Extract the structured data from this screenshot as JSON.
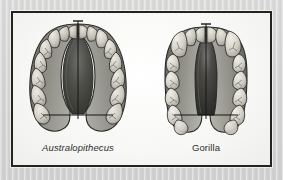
{
  "figure": {
    "kind": "comparative-anatomy-plate",
    "background_color": "#d6d6d6",
    "plate_background_color": "#fbfbfa",
    "plate_border_color": "#23231f"
  },
  "specimens": [
    {
      "id": "australopithecus",
      "label": "Australopithecus",
      "label_style": "italic",
      "arcade_shape": "parabolic",
      "palate_color": "#4a4a48",
      "tooth_color": "#cfcdc6",
      "outline_color": "#2b2b28",
      "crosshair_color": "#1c1c1a",
      "teeth_per_side": 8,
      "tooth_labels": [
        "incisor",
        "incisor",
        "canine",
        "premolar",
        "premolar",
        "molar",
        "molar",
        "molar"
      ]
    },
    {
      "id": "gorilla",
      "label": "Gorilla",
      "label_style": "roman",
      "arcade_shape": "u-shaped",
      "palate_color": "#3d3d3b",
      "tooth_color": "#d6d4cd",
      "outline_color": "#2b2b28",
      "crosshair_color": "#1c1c1a",
      "teeth_per_side": 8,
      "tooth_labels": [
        "incisor",
        "incisor",
        "canine",
        "premolar",
        "premolar",
        "molar",
        "molar",
        "molar"
      ]
    }
  ],
  "annotations": {
    "midline_name": "midline-axis",
    "breadth_name": "molar-breadth-line"
  }
}
